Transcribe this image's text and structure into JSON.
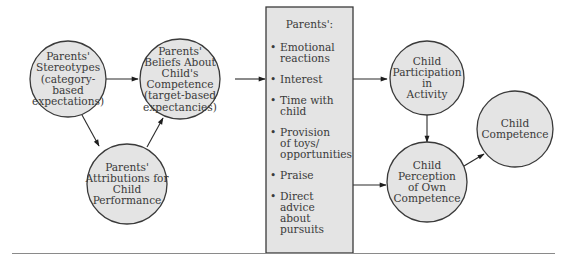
{
  "diagram": {
    "nodes": {
      "stereotypes": {
        "lines": [
          "Parents'",
          "Stereotypes",
          "(category-",
          "based",
          "expectations)"
        ]
      },
      "beliefs": {
        "lines": [
          "Parents'",
          "Beliefs About",
          "Child's",
          "Competence",
          "(target-based",
          "expectancies)"
        ]
      },
      "attributions": {
        "lines": [
          "Parents'",
          "Attributions for",
          "Child",
          "Performance"
        ]
      },
      "participation": {
        "lines": [
          "Child",
          "Participation",
          "in",
          "Activity"
        ]
      },
      "perception": {
        "lines": [
          "Child",
          "Perception",
          "of Own",
          "Competence"
        ]
      },
      "competence": {
        "lines": [
          "Child",
          "Competence"
        ]
      }
    },
    "behaviors_box": {
      "title": "Parents':",
      "items": [
        {
          "lines": [
            "Emotional",
            "reactions"
          ]
        },
        {
          "lines": [
            "Interest"
          ]
        },
        {
          "lines": [
            "Time with",
            "child"
          ]
        },
        {
          "lines": [
            "Provision",
            "of toys/",
            "opportunities"
          ]
        },
        {
          "lines": [
            "Praise"
          ]
        },
        {
          "lines": [
            "Direct",
            "advice",
            "about",
            "pursuits"
          ]
        }
      ],
      "bullet": "•"
    },
    "edges": [
      {
        "from": "stereotypes",
        "to": "beliefs"
      },
      {
        "from": "stereotypes",
        "to": "attributions"
      },
      {
        "from": "attributions",
        "to": "beliefs"
      },
      {
        "from": "beliefs",
        "to": "behaviors_box"
      },
      {
        "from": "behaviors_box",
        "to": "participation"
      },
      {
        "from": "behaviors_box",
        "to": "perception"
      },
      {
        "from": "participation",
        "to": "perception"
      },
      {
        "from": "perception",
        "to": "competence"
      }
    ],
    "colors": {
      "fill": "#e4e4e4",
      "stroke": "#3a3a3a",
      "text": "#3a3a3a"
    }
  }
}
